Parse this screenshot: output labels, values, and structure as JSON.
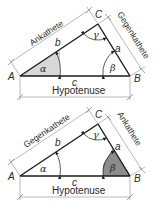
{
  "diagrams": [
    {
      "id": "alpha",
      "vertices": {
        "A": "A",
        "B": "B",
        "C": "C"
      },
      "sides": {
        "a": "a",
        "b": "b",
        "c": "c"
      },
      "angles": {
        "alpha": "α",
        "beta": "β",
        "gamma": "γ"
      },
      "dimension_labels": {
        "side_b": "Ankathete",
        "side_a": "Gegenkathete",
        "side_c": "Hypotenuse"
      },
      "highlighted_angle": "alpha",
      "highlight_color": "#d8d8d8"
    },
    {
      "id": "beta",
      "vertices": {
        "A": "A",
        "B": "B",
        "C": "C"
      },
      "sides": {
        "a": "a",
        "b": "b",
        "c": "c"
      },
      "angles": {
        "alpha": "α",
        "beta": "β",
        "gamma": "γ"
      },
      "dimension_labels": {
        "side_b": "Gegenkathete",
        "side_a": "Ankathete",
        "side_c": "Hypotenuse"
      },
      "highlighted_angle": "beta",
      "highlight_color": "#8c8c8c"
    }
  ]
}
